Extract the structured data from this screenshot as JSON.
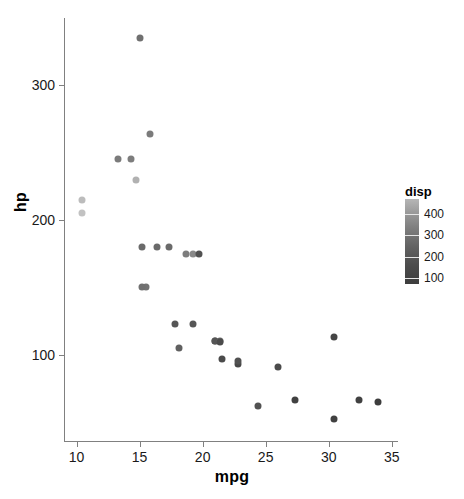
{
  "chart_data": {
    "type": "scatter",
    "title": "",
    "xlabel": "mpg",
    "ylabel": "hp",
    "xlim": [
      9.0,
      35.5
    ],
    "ylim": [
      35,
      350
    ],
    "grid": false,
    "x_ticks": [
      10,
      15,
      20,
      25,
      30,
      35
    ],
    "y_ticks": [
      100,
      200,
      300
    ],
    "x_tick_labels": [
      "10",
      "15",
      "20",
      "25",
      "30",
      "35"
    ],
    "y_tick_labels": [
      "100",
      "200",
      "300"
    ],
    "legend": {
      "title": "disp",
      "position": "right",
      "type": "continuous-colorbar",
      "ticks": [
        400,
        300,
        200,
        100
      ],
      "tick_labels": [
        "400",
        "300",
        "200",
        "100"
      ],
      "range": [
        71,
        472
      ],
      "low_color": "#3d3d3d",
      "high_color": "#c2c2c2"
    },
    "color_variable": "disp",
    "points": [
      {
        "mpg": 21.0,
        "hp": 110,
        "disp": 160.0,
        "color": "#555555"
      },
      {
        "mpg": 21.0,
        "hp": 110,
        "disp": 160.0,
        "color": "#555555"
      },
      {
        "mpg": 22.8,
        "hp": 93,
        "disp": 108.0,
        "color": "#474747"
      },
      {
        "mpg": 21.4,
        "hp": 110,
        "disp": 258.0,
        "color": "#666666"
      },
      {
        "mpg": 18.7,
        "hp": 175,
        "disp": 360.0,
        "color": "#7d7d7d"
      },
      {
        "mpg": 18.1,
        "hp": 105,
        "disp": 225.0,
        "color": "#606060"
      },
      {
        "mpg": 14.3,
        "hp": 245,
        "disp": 360.0,
        "color": "#7d7d7d"
      },
      {
        "mpg": 24.4,
        "hp": 62,
        "disp": 146.7,
        "color": "#525252"
      },
      {
        "mpg": 22.8,
        "hp": 95,
        "disp": 140.8,
        "color": "#515151"
      },
      {
        "mpg": 19.2,
        "hp": 123,
        "disp": 167.6,
        "color": "#565656"
      },
      {
        "mpg": 17.8,
        "hp": 123,
        "disp": 167.6,
        "color": "#565656"
      },
      {
        "mpg": 16.4,
        "hp": 180,
        "disp": 275.8,
        "color": "#6a6a6a"
      },
      {
        "mpg": 17.3,
        "hp": 180,
        "disp": 275.8,
        "color": "#6a6a6a"
      },
      {
        "mpg": 15.2,
        "hp": 180,
        "disp": 275.8,
        "color": "#6a6a6a"
      },
      {
        "mpg": 10.4,
        "hp": 205,
        "disp": 472.0,
        "color": "#c2c2c2"
      },
      {
        "mpg": 10.4,
        "hp": 215,
        "disp": 460.0,
        "color": "#bcbcbc"
      },
      {
        "mpg": 14.7,
        "hp": 230,
        "disp": 440.0,
        "color": "#b1b1b1"
      },
      {
        "mpg": 32.4,
        "hp": 66,
        "disp": 78.7,
        "color": "#414141"
      },
      {
        "mpg": 30.4,
        "hp": 52,
        "disp": 75.7,
        "color": "#404040"
      },
      {
        "mpg": 33.9,
        "hp": 65,
        "disp": 71.1,
        "color": "#3d3d3d"
      },
      {
        "mpg": 21.5,
        "hp": 97,
        "disp": 120.1,
        "color": "#4b4b4b"
      },
      {
        "mpg": 15.5,
        "hp": 150,
        "disp": 318.0,
        "color": "#737373"
      },
      {
        "mpg": 15.2,
        "hp": 150,
        "disp": 304.0,
        "color": "#707070"
      },
      {
        "mpg": 13.3,
        "hp": 245,
        "disp": 350.0,
        "color": "#7b7b7b"
      },
      {
        "mpg": 19.2,
        "hp": 175,
        "disp": 400.0,
        "color": "#898989"
      },
      {
        "mpg": 27.3,
        "hp": 66,
        "disp": 79.0,
        "color": "#414141"
      },
      {
        "mpg": 26.0,
        "hp": 91,
        "disp": 120.3,
        "color": "#4b4b4b"
      },
      {
        "mpg": 30.4,
        "hp": 113,
        "disp": 95.1,
        "color": "#454545"
      },
      {
        "mpg": 15.8,
        "hp": 264,
        "disp": 351.0,
        "color": "#7b7b7b"
      },
      {
        "mpg": 19.7,
        "hp": 175,
        "disp": 145.0,
        "color": "#525252"
      },
      {
        "mpg": 15.0,
        "hp": 335,
        "disp": 301.0,
        "color": "#707070"
      },
      {
        "mpg": 21.4,
        "hp": 109,
        "disp": 121.0,
        "color": "#4b4b4b"
      }
    ]
  }
}
